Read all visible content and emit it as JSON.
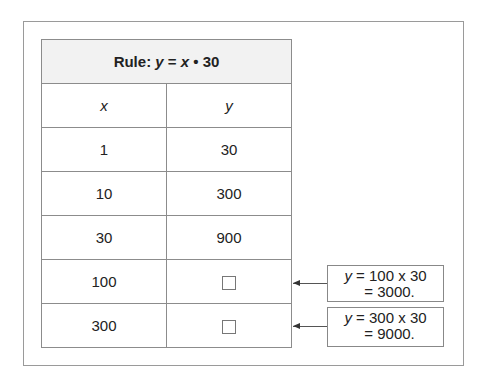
{
  "table": {
    "title_prefix": "Rule: ",
    "title_y": "y",
    "title_eq": " = ",
    "title_x": "x",
    "title_suffix": " • 30",
    "headers": [
      "x",
      "y"
    ],
    "rows": [
      {
        "x": "1",
        "y": "30"
      },
      {
        "x": "10",
        "y": "300"
      },
      {
        "x": "30",
        "y": "900"
      },
      {
        "x": "100",
        "y": ""
      },
      {
        "x": "300",
        "y": ""
      }
    ]
  },
  "callouts": [
    {
      "var": "y",
      "line1": " = 100 x 30",
      "line2": "= 3000."
    },
    {
      "var": "y",
      "line1": " = 300 x 30",
      "line2": "= 9000."
    }
  ]
}
